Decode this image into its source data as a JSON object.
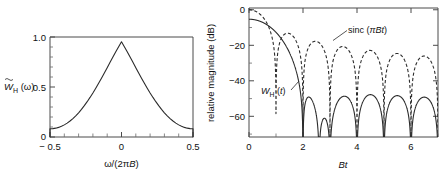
{
  "figure": {
    "width": 444,
    "height": 178,
    "background": "#ffffff",
    "ink_color": "#2b2b2b"
  },
  "chart_data": [
    {
      "id": "left-panel",
      "type": "line",
      "title": "",
      "xlabel": "ω/(2πB)",
      "ylabel": "W̃_H (ω)",
      "ylabel_parts": {
        "base": "W",
        "accent": "tilde",
        "sub": "H",
        "arg": "(ω)"
      },
      "xlim": [
        -0.5,
        0.5
      ],
      "ylim": [
        0,
        1.05
      ],
      "grid": false,
      "legend": "none",
      "xticks": [
        -0.5,
        0,
        0.5
      ],
      "xticklabels": [
        "− 0.5",
        "0",
        "0.5"
      ],
      "xminor_count": 10,
      "yticks": [
        0,
        0.5,
        1.0
      ],
      "yticklabels": [
        "0",
        "0.5",
        "1.0"
      ],
      "yminor_count": 10,
      "series": [
        {
          "name": "Hamming window spectrum",
          "style": "solid",
          "x": [
            -0.5,
            -0.48,
            -0.46,
            -0.44,
            -0.42,
            -0.4,
            -0.38,
            -0.36,
            -0.34,
            -0.32,
            -0.3,
            -0.28,
            -0.26,
            -0.24,
            -0.22,
            -0.2,
            -0.18,
            -0.16,
            -0.14,
            -0.12,
            -0.1,
            -0.08,
            -0.06,
            -0.04,
            -0.02,
            0,
            0.02,
            0.04,
            0.06,
            0.08,
            0.1,
            0.12,
            0.14,
            0.16,
            0.18,
            0.2,
            0.22,
            0.24,
            0.26,
            0.28,
            0.3,
            0.32,
            0.34,
            0.36,
            0.38,
            0.4,
            0.42,
            0.44,
            0.46,
            0.48,
            0.5
          ],
          "y": [
            0.08,
            0.0815,
            0.086,
            0.0935,
            0.1042,
            0.118,
            0.1351,
            0.1554,
            0.179,
            0.2058,
            0.2357,
            0.2688,
            0.3048,
            0.3436,
            0.3851,
            0.429,
            0.4751,
            0.523,
            0.5725,
            0.6232,
            0.6746,
            0.7264,
            0.778,
            0.8289,
            0.8787,
            0.9268,
            0.8787,
            0.8289,
            0.778,
            0.7264,
            0.6746,
            0.6232,
            0.5725,
            0.523,
            0.4751,
            0.429,
            0.3851,
            0.3436,
            0.3048,
            0.2688,
            0.2357,
            0.2058,
            0.179,
            0.1554,
            0.1351,
            0.118,
            0.1042,
            0.0935,
            0.086,
            0.0815,
            0.08
          ],
          "note": "raised-cosine (Hamming) transform, peak normalized to 1.0 at ω=0, drops vertically to 0 at ±0.5"
        }
      ],
      "annotations": []
    },
    {
      "id": "right-panel",
      "type": "line",
      "title": "",
      "xlabel": "Bt",
      "ylabel": "relative magnitude (dB)",
      "xlim": [
        0,
        7
      ],
      "ylim": [
        -72,
        1
      ],
      "grid": false,
      "legend": "inline-annotations",
      "xticks": [
        0,
        2,
        4,
        6
      ],
      "xticklabels": [
        "0",
        "2",
        "4",
        "6"
      ],
      "xminor_count": 14,
      "yticks": [
        0,
        -20,
        -40,
        -60
      ],
      "yticklabels": [
        "0",
        "−20",
        "−40",
        "−60"
      ],
      "yminor_count": 8,
      "series": [
        {
          "name": "sinc (πBt)",
          "style": "dashed",
          "nulls": [
            1,
            2,
            3,
            4,
            5,
            6,
            7
          ],
          "sidelobe_peaks_db": [
            -13.3,
            -17.8,
            -20.8,
            -23.0,
            -24.7,
            -26.2
          ],
          "sidelobe_peak_x": [
            1.43,
            2.46,
            3.47,
            4.48,
            5.48,
            6.48
          ]
        },
        {
          "name": "W_H (t)",
          "style": "solid",
          "nulls": [
            1.95,
            2.6,
            3.05,
            4.05,
            5.05,
            6.05,
            7.0
          ],
          "sidelobe_peaks_db": [
            -43.2,
            -57.5,
            -44.5,
            -44.0,
            -44.5,
            -44.8
          ],
          "sidelobe_peak_x": [
            2.25,
            2.8,
            3.55,
            4.55,
            5.55,
            6.55
          ]
        }
      ],
      "annotations": [
        {
          "name": "sinc-label",
          "text": "sinc (πBt)",
          "x": 3.3,
          "y_db": -12.5
        },
        {
          "name": "wh-label",
          "text": "W_H (t)",
          "x": 0.95,
          "y_db": -47
        }
      ]
    }
  ]
}
